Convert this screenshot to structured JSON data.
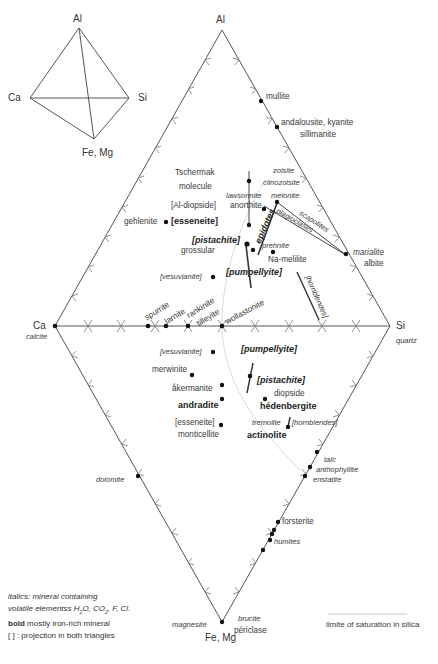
{
  "small_tetrahedron": {
    "vertices": {
      "top": "Al",
      "left": "Ca",
      "right": "Si",
      "bottom": "Fe, Mg"
    }
  },
  "diagram": {
    "vertices": {
      "top": "Al",
      "left": "Ca",
      "left_sub": "calcite",
      "right": "Si",
      "right_sub": "quartz",
      "bottom": "Fe, Mg"
    },
    "upper_triangle_minerals": [
      {
        "name": "mullite",
        "style": "normal"
      },
      {
        "name": "andalousite, kyanite",
        "style": "normal"
      },
      {
        "name": "sillimanite",
        "style": "normal"
      },
      {
        "name": "zoisite",
        "style": "italic"
      },
      {
        "name": "clinozoisite",
        "style": "italic"
      },
      {
        "name": "Tschermak",
        "style": "normal"
      },
      {
        "name": "molecule",
        "style": "normal"
      },
      {
        "name": "lawsonnite",
        "style": "italic"
      },
      {
        "name": "meionite",
        "style": "italic"
      },
      {
        "name": "[Al-diopside]",
        "style": "normal"
      },
      {
        "name": "anorthite",
        "style": "normal"
      },
      {
        "name": "gehlenite",
        "style": "normal"
      },
      {
        "name": "[esseneite]",
        "style": "bold"
      },
      {
        "name": "epidotes",
        "style": "bold-italic"
      },
      {
        "name": "plagioclases",
        "style": "italic"
      },
      {
        "name": "scapolites",
        "style": "italic"
      },
      {
        "name": "[pistachite]",
        "style": "bold-italic"
      },
      {
        "name": "prehnite",
        "style": "italic"
      },
      {
        "name": "grossular",
        "style": "normal"
      },
      {
        "name": "Na-melilite",
        "style": "normal"
      },
      {
        "name": "marialite",
        "style": "italic"
      },
      {
        "name": "albite",
        "style": "normal"
      },
      {
        "name": "[pumpellyite]",
        "style": "bold-italic"
      },
      {
        "name": "[vesuvianite]",
        "style": "italic"
      },
      {
        "name": "[hornblendes]",
        "style": "italic"
      }
    ],
    "join_minerals": [
      {
        "name": "spurrite",
        "style": "normal"
      },
      {
        "name": "larnite",
        "style": "normal"
      },
      {
        "name": "rankinite",
        "style": "normal"
      },
      {
        "name": "tilleyite",
        "style": "normal"
      },
      {
        "name": "wollastonite",
        "style": "normal"
      }
    ],
    "lower_triangle_minerals": [
      {
        "name": "[vesuvianite]",
        "style": "italic"
      },
      {
        "name": "[pumpellyite]",
        "style": "bold-italic"
      },
      {
        "name": "merwinite",
        "style": "normal"
      },
      {
        "name": "[pistachite]",
        "style": "bold-italic"
      },
      {
        "name": "åkermanite",
        "style": "normal"
      },
      {
        "name": "diopside",
        "style": "normal"
      },
      {
        "name": "andradite",
        "style": "bold"
      },
      {
        "name": "hédenbergite",
        "style": "bold"
      },
      {
        "name": "[esseneite]",
        "style": "normal"
      },
      {
        "name": "tremolite",
        "style": "italic"
      },
      {
        "name": "[hornblendes]",
        "style": "italic"
      },
      {
        "name": "monticellite",
        "style": "normal"
      },
      {
        "name": "actinolite",
        "style": "bold"
      },
      {
        "name": "talc",
        "style": "italic"
      },
      {
        "name": "anthophyllite",
        "style": "italic"
      },
      {
        "name": "enstatite",
        "style": "italic"
      },
      {
        "name": "dolomite",
        "style": "italic"
      },
      {
        "name": "forsterite",
        "style": "normal"
      },
      {
        "name": "humites",
        "style": "italic"
      },
      {
        "name": "magnesite",
        "style": "italic"
      },
      {
        "name": "brucite",
        "style": "italic"
      },
      {
        "name": "périclase",
        "style": "normal"
      }
    ],
    "labels": {
      "mullite": "mullite",
      "andalousite": "andalousite, kyanite",
      "sillimanite": "sillimanite",
      "zoisite": "zoisite",
      "clinozoisite": "clinozoisite",
      "tschermak": "Tschermak",
      "molecule": "molecule",
      "lawsonnite": "lawsonnite",
      "meionite": "meionite",
      "al_diopside": "[Al-diopside]",
      "anorthite": "anorthite",
      "gehlenite": "gehlenite",
      "esseneite_up": "[esseneite]",
      "epidotes": "epidotes",
      "plagioclases": "plagioclases",
      "scapolites": "scapolites",
      "pistachite_up": "[pistachite]",
      "prehnite": "prehnite",
      "grossular": "grossular",
      "na_melilite": "Na-melilite",
      "marialite": "marialite",
      "albite": "albite",
      "pumpellyite_up": "[pumpellyite]",
      "vesuvianite_up": "[vesuvianite]",
      "hornblendes_up": "[hornblendes]",
      "spurrite": "spurrite",
      "larnite": "larnite",
      "rankinite": "rankinite",
      "tilleyite": "tilleyite",
      "wollastonite": "wollastonite",
      "vesuvianite_low": "[vesuvianite]",
      "pumpellyite_low": "[pumpellyite]",
      "merwinite": "merwinite",
      "pistachite_low": "[pistachite]",
      "akermanite": "åkermanite",
      "diopside": "diopside",
      "andradite": "andradite",
      "hedenbergite": "hédenbergite",
      "esseneite_low": "[esseneite]",
      "tremolite": "tremolite",
      "hornblendes_low": "[hornblendes]",
      "monticellite": "monticellite",
      "actinolite": "actinolite",
      "talc": "talc",
      "anthophyllite": "anthophyllite",
      "enstatite": "enstatite",
      "dolomite": "dolomite",
      "forsterite": "forsterite",
      "humites": "humites",
      "magnesite": "magnesite",
      "brucite": "brucite",
      "periclase": "périclase"
    }
  },
  "legend": {
    "line1": "italics: mineral containing",
    "line2_pre": "volatile elementss H",
    "line2_sub1": "2",
    "line2_mid": "O, CO",
    "line2_sub2": "2",
    "line2_post": ", F, Cl.",
    "line3_bold": "bold",
    "line3_rest": " mostly iron-rich mineral",
    "line4": "[ ] : projection in both triangles",
    "saturation_label": "limite of saturation in silica"
  },
  "colors": {
    "line": "#555555",
    "dot": "#111111",
    "saturation_curve": "#d8d8d8",
    "text": "#333333"
  }
}
